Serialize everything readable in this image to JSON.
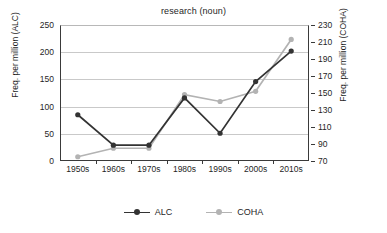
{
  "chart_data": {
    "type": "line",
    "title": "research (noun)",
    "xlabel": "",
    "categories": [
      "1950s",
      "1960s",
      "1970s",
      "1980s",
      "1990s",
      "2000s",
      "2010s"
    ],
    "grid": true,
    "legend_position": "bottom",
    "axes": {
      "left": {
        "label": "Freq. per million (ALC)",
        "ticks": [
          0,
          50,
          100,
          150,
          200,
          250
        ],
        "ylim": [
          0,
          250
        ]
      },
      "right": {
        "label": "Freq. per million (COHA)",
        "ticks": [
          70,
          90,
          110,
          130,
          150,
          170,
          190,
          210,
          230
        ],
        "ylim": [
          70,
          230
        ]
      }
    },
    "series": [
      {
        "name": "ALC",
        "axis": "left",
        "color": "#333333",
        "values": [
          85,
          29,
          29,
          116,
          51,
          146,
          202
        ]
      },
      {
        "name": "COHA",
        "axis": "right",
        "color": "#b3b3b3",
        "values": [
          75,
          85,
          85,
          148,
          140,
          152,
          213
        ]
      }
    ]
  },
  "legend": {
    "items": [
      {
        "label": "ALC",
        "color": "#333333"
      },
      {
        "label": "COHA",
        "color": "#b3b3b3"
      }
    ]
  }
}
